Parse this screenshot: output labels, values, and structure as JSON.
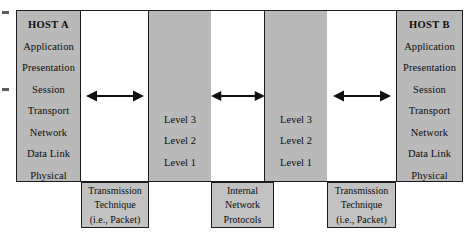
{
  "figure": {
    "colors": {
      "box_fill": "#b9b9b9",
      "caption_fill": "#c2c2c2",
      "white_fill": "#ffffff",
      "stroke": "#1c1c1c",
      "text": "#0d0d0d"
    }
  },
  "host_a": {
    "name": "host-a-stack",
    "title": "HOST A",
    "layers": [
      "Application",
      "Presentation",
      "Session",
      "Transport",
      "Network",
      "Data Link",
      "Physical"
    ]
  },
  "host_b": {
    "name": "host-b-stack",
    "title": "HOST B",
    "layers": [
      "Application",
      "Presentation",
      "Session",
      "Transport",
      "Network",
      "Data Link",
      "Physical"
    ]
  },
  "node_left": {
    "name": "intermediate-node-left",
    "levels": [
      "Level 3",
      "Level 2",
      "Level 1"
    ]
  },
  "node_right": {
    "name": "intermediate-node-right",
    "levels": [
      "Level 3",
      "Level 2",
      "Level 1"
    ]
  },
  "arrows": [
    {
      "id": "arrow-left",
      "glyph": "double-headed-arrow"
    },
    {
      "id": "arrow-middle",
      "glyph": "double-headed-arrow"
    },
    {
      "id": "arrow-right",
      "glyph": "double-headed-arrow"
    }
  ],
  "captions": [
    {
      "id": "caption-transmission-left",
      "lines": [
        "Transmission",
        "Technique",
        "(i.e., Packet)"
      ]
    },
    {
      "id": "caption-internal-network",
      "lines": [
        "Internal",
        "Network",
        "Protocols"
      ]
    },
    {
      "id": "caption-transmission-right",
      "lines": [
        "Transmission",
        "Technique",
        "(i.e., Packet)"
      ]
    }
  ]
}
